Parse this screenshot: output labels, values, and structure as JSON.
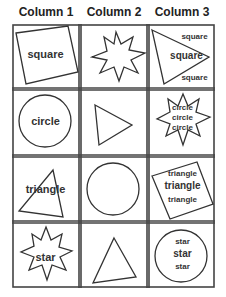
{
  "headers": [
    "Column 1",
    "Column 2",
    "Column 3"
  ],
  "rows": [
    {
      "col1": {
        "shape": "square",
        "label": "square"
      },
      "col2": {
        "shape": "star"
      },
      "col3": {
        "shape": "triangle",
        "labels": [
          "square",
          "square",
          "square"
        ]
      }
    },
    {
      "col1": {
        "shape": "circle",
        "label": "circle"
      },
      "col2": {
        "shape": "triangle"
      },
      "col3": {
        "shape": "star",
        "labels": [
          "circle",
          "circle",
          "circle"
        ]
      }
    },
    {
      "col1": {
        "shape": "triangle",
        "label": "triangle"
      },
      "col2": {
        "shape": "circle"
      },
      "col3": {
        "shape": "square",
        "labels": [
          "triangle",
          "triangle",
          "triangle"
        ]
      }
    },
    {
      "col1": {
        "shape": "star",
        "label": "star"
      },
      "col2": {
        "shape": "triangle"
      },
      "col3": {
        "shape": "circle",
        "labels": [
          "star",
          "star",
          "star"
        ]
      }
    }
  ],
  "colors": {
    "stroke": "#333333",
    "grid": "#444444",
    "text": "#333333"
  }
}
